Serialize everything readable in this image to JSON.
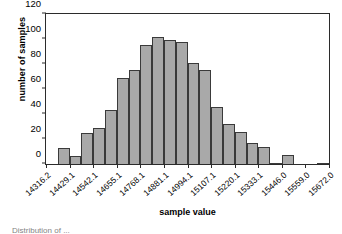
{
  "chart_data": {
    "type": "bar",
    "title": "",
    "subtitle": "",
    "xlabel": "sample value",
    "ylabel": "number of samples",
    "ylim": [
      0,
      120
    ],
    "yticks": [
      0,
      20,
      40,
      60,
      80,
      100,
      120
    ],
    "ytick_labels": [
      "0",
      "20",
      "40",
      "60",
      "80",
      "100",
      "120"
    ],
    "grid": false,
    "legend": null,
    "bar_color": "#a9a9a9",
    "bar_edge_color": "#3a3a3a",
    "axis_color": "#2b2b2b",
    "background": "#ffffff",
    "xtick_labels": [
      "14316.2",
      "14429.1",
      "14542.1",
      "14655.1",
      "14768.1",
      "14881.1",
      "14994.1",
      "15107.1",
      "15220.1",
      "15333.1",
      "15446.0",
      "15559.0",
      "15672.0"
    ],
    "xtick_bar_index": [
      0,
      2,
      4,
      6,
      8,
      10,
      12,
      14,
      16,
      18,
      20,
      22,
      24
    ],
    "n_bins": 24,
    "categories": [
      "14316.2",
      "14372.7",
      "14429.1",
      "14485.6",
      "14542.1",
      "14598.6",
      "14655.1",
      "14711.6",
      "14768.1",
      "14824.6",
      "14881.1",
      "14937.6",
      "14994.1",
      "15050.6",
      "15107.1",
      "15163.6",
      "15220.1",
      "15276.6",
      "15333.1",
      "15389.5",
      "15446.0",
      "15502.5",
      "15559.0",
      "15615.5"
    ],
    "values": [
      0,
      13,
      6.5,
      25,
      29,
      43.5,
      69,
      75,
      95.5,
      101.5,
      99,
      97.5,
      80.5,
      75,
      46,
      32,
      26,
      17,
      14,
      0.5,
      7.5,
      0,
      0,
      0.5
    ]
  },
  "caption": {
    "text": "Distribution of ..."
  }
}
